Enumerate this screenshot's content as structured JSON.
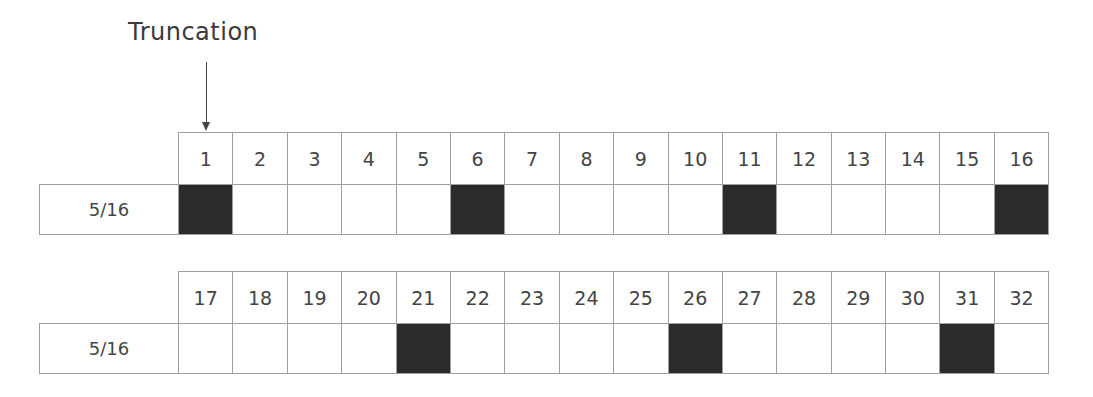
{
  "title": "Truncation",
  "colors": {
    "filled": "#2b2b2b",
    "border": "#a0a0a0",
    "text": "#444444"
  },
  "blocks": [
    {
      "label": "5/16",
      "positions": [
        "1",
        "2",
        "3",
        "4",
        "5",
        "6",
        "7",
        "8",
        "9",
        "10",
        "11",
        "12",
        "13",
        "14",
        "15",
        "16"
      ],
      "filled": [
        true,
        false,
        false,
        false,
        false,
        true,
        false,
        false,
        false,
        false,
        true,
        false,
        false,
        false,
        false,
        true
      ]
    },
    {
      "label": "5/16",
      "positions": [
        "17",
        "18",
        "19",
        "20",
        "21",
        "22",
        "23",
        "24",
        "25",
        "26",
        "27",
        "28",
        "29",
        "30",
        "31",
        "32"
      ],
      "filled": [
        false,
        false,
        false,
        false,
        true,
        false,
        false,
        false,
        false,
        true,
        false,
        false,
        false,
        false,
        true,
        false
      ]
    }
  ]
}
